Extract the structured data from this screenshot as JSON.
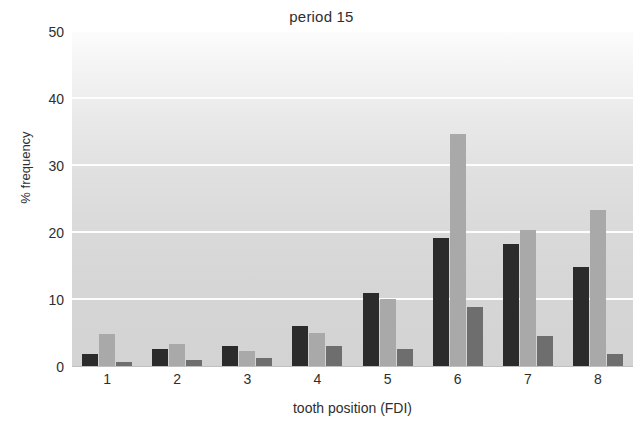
{
  "chart_data": {
    "type": "bar",
    "title": "period 15",
    "xlabel": "tooth position (FDI)",
    "ylabel": "% frequency",
    "categories": [
      "1",
      "2",
      "3",
      "4",
      "5",
      "6",
      "7",
      "8"
    ],
    "yticks": [
      0,
      10,
      20,
      30,
      40,
      50
    ],
    "ylim": [
      0,
      50
    ],
    "grid": true,
    "legend": "none",
    "series": [
      {
        "name": "series-1",
        "color": "#2b2b2b",
        "values": [
          1.9,
          2.7,
          3.2,
          6.1,
          11.0,
          19.3,
          18.4,
          15.0
        ]
      },
      {
        "name": "series-2",
        "color": "#a9a9a9",
        "values": [
          4.9,
          3.4,
          2.4,
          5.1,
          10.2,
          34.8,
          20.5,
          23.4
        ]
      },
      {
        "name": "series-3",
        "color": "#6e6e6e",
        "values": [
          0.8,
          1.1,
          1.3,
          3.1,
          2.7,
          9.0,
          4.6,
          2.0
        ]
      }
    ],
    "colors": {
      "plot_background_top": "#fcfcfc",
      "plot_background_bottom": "#d3d3d3",
      "gridline": "#fdfdfd",
      "text": "#2e2e2e"
    }
  }
}
